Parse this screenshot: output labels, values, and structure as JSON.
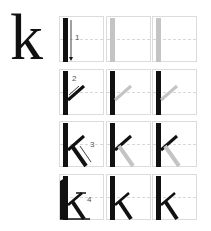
{
  "letter": "k",
  "colors": {
    "stroke": "#111111",
    "trace": "#c4c4c4",
    "grid": "#dcdcdc"
  },
  "rows": [
    {
      "step": "1",
      "cells": [
        "guided",
        "trace",
        "trace"
      ]
    },
    {
      "step": "2",
      "cells": [
        "guided",
        "trace",
        "trace"
      ]
    },
    {
      "step": "3",
      "cells": [
        "guided",
        "trace",
        "trace"
      ]
    },
    {
      "step": "4",
      "cells": [
        "complete",
        "complete",
        "complete"
      ]
    }
  ]
}
